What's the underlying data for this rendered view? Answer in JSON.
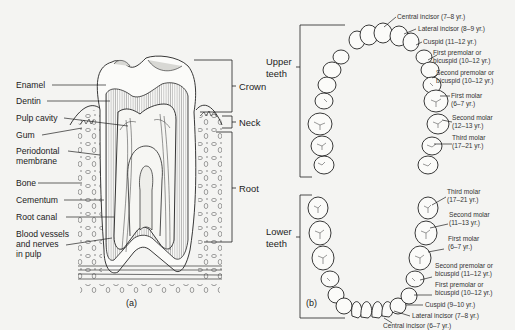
{
  "figure": {
    "panel_a": {
      "caption": "(a)",
      "left_labels": [
        {
          "text": "Enamel"
        },
        {
          "text": "Dentin"
        },
        {
          "text": "Pulp cavity"
        },
        {
          "text": "Gum"
        },
        {
          "text": "Periodontal",
          "text2": "membrane"
        },
        {
          "text": "Bone"
        },
        {
          "text": "Cementum"
        },
        {
          "text": "Root canal"
        },
        {
          "text": "Blood vessels",
          "text2": "and nerves",
          "text3": "in pulp"
        }
      ],
      "right_labels": [
        {
          "text": "Crown"
        },
        {
          "text": "Neck"
        },
        {
          "text": "Root"
        }
      ]
    },
    "panel_b": {
      "caption": "(b)",
      "upper_label": {
        "text": "Upper",
        "text2": "teeth"
      },
      "lower_label": {
        "text": "Lower",
        "text2": "teeth"
      },
      "upper_teeth": [
        {
          "text": "Central incisor (7–8 yr.)"
        },
        {
          "text": "Lateral incisor (8–9 yr.)"
        },
        {
          "text": "Cuspid (11–12 yr.)"
        },
        {
          "text": "First premolar or",
          "text2": "bicuspid (10–12 yr.)"
        },
        {
          "text": "Second premolar or",
          "text2": "bicuspid (10–12 yr.)"
        },
        {
          "text": "First molar",
          "text2": "(6–7 yr.)"
        },
        {
          "text": "Second molar",
          "text2": "(12–13 yr.)"
        },
        {
          "text": "Third molar",
          "text2": "(17–21 yr.)"
        }
      ],
      "lower_teeth": [
        {
          "text": "Third molar",
          "text2": "(17–21 yr.)"
        },
        {
          "text": "Second molar",
          "text2": "(11–13 yr.)"
        },
        {
          "text": "First molar",
          "text2": "(6–7 yr.)"
        },
        {
          "text": "Second premolar or",
          "text2": "bicuspid (11–12 yr.)"
        },
        {
          "text": "First premolar or",
          "text2": "bicuspid (10–12 yr.)"
        },
        {
          "text": "Cuspid (9–10 yr.)"
        },
        {
          "text": "Lateral incisor (7–8 yr.)"
        },
        {
          "text": "Central incisor (6–7 yr.)"
        }
      ]
    }
  }
}
